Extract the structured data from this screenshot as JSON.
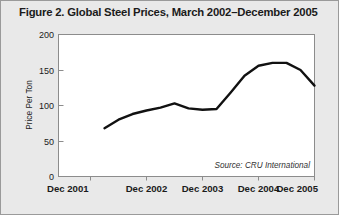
{
  "figure": {
    "title": "Figure 2. Global Steel Prices, March 2002–December 2005",
    "source_note": "Source: CRU International",
    "background_color": "#e9e9e9",
    "plot_background_color": "#ffffff",
    "line_color": "#111111",
    "frame_color": "#8c8c8c"
  },
  "chart_data": {
    "type": "line",
    "title": "Figure 2. Global Steel Prices, March 2002–December 2005",
    "xlabel": "",
    "ylabel": "Price Per Ton",
    "ylim": [
      0,
      200
    ],
    "yticks": [
      0,
      50,
      100,
      150,
      200
    ],
    "ytick_labels": [
      "0",
      "50",
      "100",
      "150",
      "200"
    ],
    "xlim": [
      "Dec 2001",
      "Dec 2005"
    ],
    "xticks": [
      "Dec 2001",
      "Dec 2002",
      "Dec 2003",
      "Dec 2004",
      "Dec 2005"
    ],
    "xtick_labels": [
      "Dec 2001",
      "Dec 2002",
      "Dec 2003",
      "Dec 2004",
      "Dec 2005"
    ],
    "grid": false,
    "legend": false,
    "annotations": [
      "Source: CRU International"
    ],
    "series": [
      {
        "name": "Global Steel Price",
        "x": [
          "Mar 2002",
          "Jun 2002",
          "Sep 2002",
          "Dec 2002",
          "Mar 2003",
          "Jun 2003",
          "Sep 2003",
          "Dec 2003",
          "Mar 2004",
          "Jun 2004",
          "Sep 2004",
          "Dec 2004",
          "Mar 2005",
          "Jun 2005",
          "Sep 2005",
          "Dec 2005"
        ],
        "values": [
          68,
          80,
          88,
          93,
          97,
          103,
          96,
          94,
          95,
          118,
          142,
          156,
          160,
          160,
          150,
          128
        ]
      }
    ]
  }
}
